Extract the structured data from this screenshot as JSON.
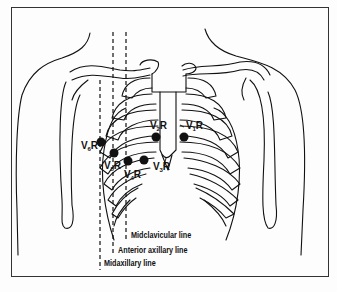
{
  "figure": {
    "electrodes": [
      {
        "id": "V1R",
        "prefix": "V",
        "sub": "1",
        "suffix": "R",
        "dot": [
          184,
          137
        ],
        "label_pos": [
          185,
          121
        ]
      },
      {
        "id": "V2R",
        "prefix": "V",
        "sub": "2",
        "suffix": "R",
        "dot": [
          156,
          137
        ],
        "label_pos": [
          149,
          121
        ]
      },
      {
        "id": "V3R",
        "prefix": "V",
        "sub": "3",
        "suffix": "R",
        "dot": [
          144,
          160
        ],
        "label_pos": [
          152,
          162
        ]
      },
      {
        "id": "V4R",
        "prefix": "V",
        "sub": "4",
        "suffix": "R",
        "dot": [
          128,
          161
        ],
        "label_pos": [
          123,
          170
        ]
      },
      {
        "id": "V5R",
        "prefix": "V",
        "sub": "5",
        "suffix": "R",
        "dot": [
          114,
          153
        ],
        "label_pos": [
          103,
          160
        ]
      },
      {
        "id": "V6R",
        "prefix": "V",
        "sub": "6",
        "suffix": "R",
        "dot": [
          101,
          142
        ],
        "label_pos": [
          80,
          141
        ]
      }
    ],
    "reference_lines": [
      {
        "name": "Midclavicular line",
        "x": 126,
        "y1": 32,
        "y2": 240
      },
      {
        "name": "Anterior axillary line",
        "x": 113,
        "y1": 32,
        "y2": 255
      },
      {
        "name": "Midaxillary line",
        "x": 100,
        "y1": 80,
        "y2": 270
      }
    ],
    "legend": {
      "midclavicular": "Midclavicular line",
      "anterior_axillary": "Anterior axillary line",
      "midaxillary": "Midaxillary line"
    },
    "colors": {
      "ink": "#111111",
      "background": "#fdfdfd",
      "frame": "#333333"
    }
  }
}
